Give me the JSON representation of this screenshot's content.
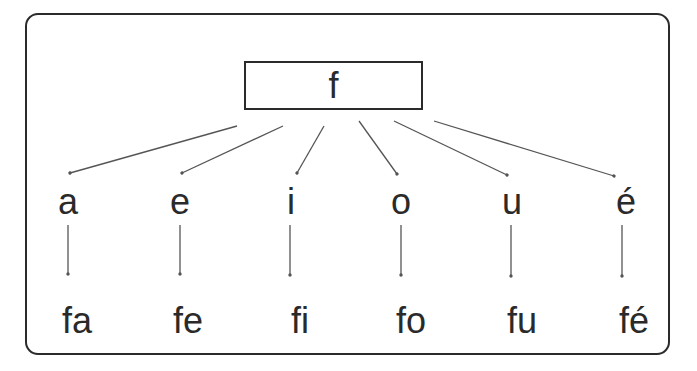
{
  "diagram": {
    "root": {
      "label": "f"
    },
    "branches": [
      {
        "vowel": "a",
        "syllable": "fa"
      },
      {
        "vowel": "e",
        "syllable": "fe"
      },
      {
        "vowel": "i",
        "syllable": "fi"
      },
      {
        "vowel": "o",
        "syllable": "fo"
      },
      {
        "vowel": "u",
        "syllable": "fu"
      },
      {
        "vowel": "é",
        "syllable": "fé"
      }
    ]
  },
  "colors": {
    "stroke": "#2b2b2b",
    "arrow": "#555555",
    "text": "#2a2a2a",
    "background": "#ffffff"
  }
}
